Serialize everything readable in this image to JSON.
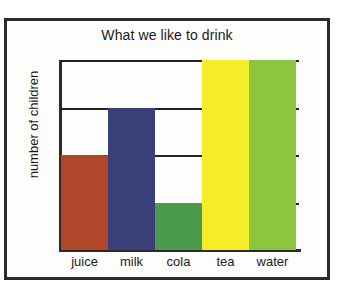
{
  "frame": {
    "border_color": "#2b2b2b",
    "background": "#fdfdfb"
  },
  "chart_data": {
    "type": "bar",
    "title": "What we like to drink",
    "xlabel": "",
    "ylabel": "number of children",
    "categories": [
      "juice",
      "milk",
      "cola",
      "tea",
      "water"
    ],
    "values": [
      2,
      3,
      1,
      4,
      4
    ],
    "ylim": [
      0,
      4
    ],
    "ytick_values": [
      0,
      1,
      2,
      3,
      4
    ],
    "ytick_labels": [
      "",
      "",
      "",
      "",
      ""
    ],
    "grid": true,
    "legend": false,
    "bar_colors": [
      "#b0462a",
      "#3a3f7a",
      "#4a9b4a",
      "#f5ed2a",
      "#8cc63f"
    ],
    "series": [
      {
        "name": "number of children",
        "values": [
          2,
          3,
          1,
          4,
          4
        ]
      }
    ],
    "bars": [
      {
        "category": "juice",
        "value": 2,
        "color": "#b0462a"
      },
      {
        "category": "milk",
        "value": 3,
        "color": "#3a3f7a"
      },
      {
        "category": "cola",
        "value": 1,
        "color": "#4a9b4a"
      },
      {
        "category": "tea",
        "value": 4,
        "color": "#f5ed2a"
      },
      {
        "category": "water",
        "value": 4,
        "color": "#8cc63f"
      }
    ]
  }
}
